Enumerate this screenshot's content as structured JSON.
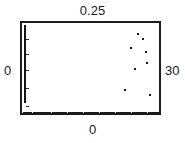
{
  "figure": {
    "labels": {
      "top": "0.25",
      "left": "0",
      "right": "30",
      "bottom": "0"
    }
  },
  "chart_data": {
    "type": "scatter",
    "title": "0.25",
    "xlabel": "0",
    "ylabel": "0",
    "right_label": "30",
    "xlim": [
      0,
      30
    ],
    "ylim": [
      0,
      0.25
    ],
    "grid": false,
    "legend": null,
    "axis_ticks": {
      "y_tick_positions": [
        0.02,
        0.07,
        0.12,
        0.165,
        0.205
      ],
      "x_tick_labels": [
        "0"
      ],
      "y_tick_labels": [
        "0"
      ]
    },
    "series": [
      {
        "name": "baseline",
        "description": "dense row of markers along the bottom axis",
        "x": [
          0.2,
          0.9,
          1.6,
          2.3,
          3.0,
          3.7,
          4.4,
          5.1,
          5.8,
          6.5,
          7.2,
          7.9,
          8.6,
          9.3,
          10.0,
          10.7,
          11.4,
          12.1,
          12.8,
          13.5,
          14.2,
          14.9,
          15.6,
          16.3,
          17.0,
          17.7,
          18.4,
          19.1,
          19.8,
          20.5,
          21.2,
          21.9,
          22.6,
          23.3,
          24.0,
          24.7,
          25.4,
          26.1,
          26.8,
          27.5,
          28.2,
          28.9,
          29.5
        ],
        "y": [
          0.004,
          0.004,
          0.004,
          0.004,
          0.004,
          0.004,
          0.004,
          0.004,
          0.004,
          0.004,
          0.004,
          0.004,
          0.004,
          0.004,
          0.004,
          0.004,
          0.004,
          0.004,
          0.004,
          0.004,
          0.004,
          0.004,
          0.004,
          0.004,
          0.004,
          0.004,
          0.004,
          0.004,
          0.004,
          0.004,
          0.004,
          0.004,
          0.004,
          0.004,
          0.004,
          0.004,
          0.004,
          0.004,
          0.004,
          0.004,
          0.004,
          0.004,
          0.004
        ]
      },
      {
        "name": "scattered",
        "description": "sparse points in the upper-right region",
        "x": [
          25.1,
          26.2,
          23.6,
          26.9,
          27.2,
          24.6,
          22.4,
          27.8
        ],
        "y": [
          0.222,
          0.209,
          0.182,
          0.173,
          0.143,
          0.125,
          0.068,
          0.052
        ]
      }
    ]
  }
}
